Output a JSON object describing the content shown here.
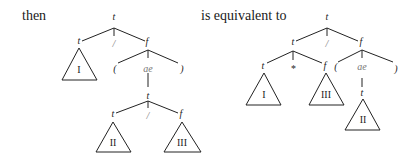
{
  "text": {
    "left_caption": "then",
    "right_caption": "is equivalent to"
  },
  "left_tree": {
    "root": "t",
    "children": [
      "t",
      "/",
      "f"
    ],
    "subtree_I": "I",
    "f_children": [
      "(",
      "ae",
      ")"
    ],
    "ae_child": "t",
    "inner_children": [
      "t",
      "/",
      "f"
    ],
    "subtree_II": "II",
    "subtree_III": "III"
  },
  "right_tree": {
    "root": "t",
    "children": [
      "t",
      "/",
      "f"
    ],
    "t_children": [
      "t",
      "*",
      "f"
    ],
    "subtree_I": "I",
    "subtree_III": "III",
    "f_children": [
      "(",
      "ae",
      ")"
    ],
    "ae_child": "t",
    "subtree_II": "II"
  }
}
